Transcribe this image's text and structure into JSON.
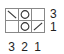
{
  "puzzle": {
    "rows": 2,
    "cols": 3,
    "cells": [
      [
        "backslash",
        "circle",
        "empty"
      ],
      [
        "empty",
        "circle",
        "slash"
      ]
    ],
    "row_clues": [
      "3",
      "1"
    ],
    "col_clues": [
      "3",
      "2",
      "1"
    ]
  }
}
